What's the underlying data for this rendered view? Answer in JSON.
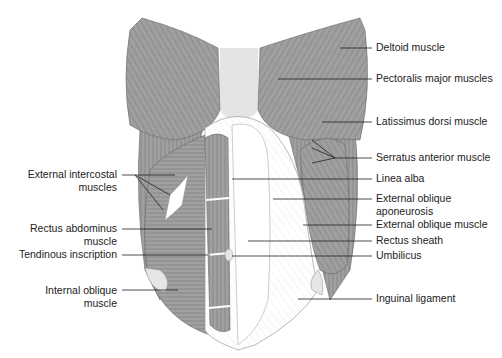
{
  "diagram": {
    "colors": {
      "muscle_fill": "#9a9a9a",
      "muscle_line": "#5a5a5a",
      "sternum_fill": "#e4e4e4",
      "aponeurosis_fill": "#ffffff",
      "leader_line": "#222222",
      "label_text": "#222222"
    },
    "labels_right": [
      {
        "id": "deltoid",
        "text": "Deltoid muscle"
      },
      {
        "id": "pectoralis",
        "text": "Pectoralis major muscles"
      },
      {
        "id": "latissimus",
        "text": "Latissimus dorsi muscle"
      },
      {
        "id": "serratus",
        "text": "Serratus anterior muscle"
      },
      {
        "id": "linea_alba",
        "text": "Linea alba"
      },
      {
        "id": "ext_oblique_apo_1",
        "text": "External oblique"
      },
      {
        "id": "ext_oblique_apo_2",
        "text": "aponeurosis"
      },
      {
        "id": "ext_oblique_muscle",
        "text": "External oblique muscle"
      },
      {
        "id": "rectus_sheath",
        "text": "Rectus sheath"
      },
      {
        "id": "umbilicus",
        "text": "Umbilicus"
      },
      {
        "id": "inguinal",
        "text": "Inguinal ligament"
      }
    ],
    "labels_left": [
      {
        "id": "ext_intercostal_1",
        "text": "External intercostal"
      },
      {
        "id": "ext_intercostal_2",
        "text": "muscles"
      },
      {
        "id": "rectus_abd_1",
        "text": "Rectus abdominus"
      },
      {
        "id": "rectus_abd_2",
        "text": "muscle"
      },
      {
        "id": "tendinous",
        "text": "Tendinous inscription"
      },
      {
        "id": "int_oblique_1",
        "text": "Internal oblique"
      },
      {
        "id": "int_oblique_2",
        "text": "muscle"
      }
    ]
  }
}
